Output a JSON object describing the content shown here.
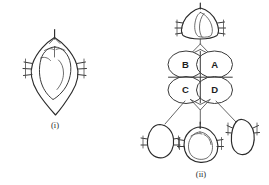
{
  "figure": {
    "kind": "line-art-diagram",
    "background_color": "#ffffff",
    "ink_color": "#3a3a3a",
    "width": 269,
    "height": 185
  },
  "panels": [
    {
      "id": "panel-i",
      "caption": "(i)",
      "description": "single rhomboid structure with inner oval body, apical stem and lateral tick marks"
    },
    {
      "id": "panel-ii",
      "caption": "(ii)",
      "description": "four-celled quadrant with labelled cells connected by lines to four derived structures"
    }
  ],
  "quadrant": {
    "cells": [
      {
        "id": "cell-b",
        "label": "B",
        "position": "top-left"
      },
      {
        "id": "cell-a",
        "label": "A",
        "position": "top-right"
      },
      {
        "id": "cell-c",
        "label": "C",
        "position": "bottom-left"
      },
      {
        "id": "cell-d",
        "label": "D",
        "position": "bottom-right"
      }
    ]
  },
  "derived_structures": [
    {
      "id": "structure-top",
      "position": "top",
      "from_cells": "A,B"
    },
    {
      "id": "structure-bottom-left",
      "position": "bottom-left",
      "from_cells": "C"
    },
    {
      "id": "structure-bottom-center",
      "position": "bottom-center",
      "from_cells": "C,D"
    },
    {
      "id": "structure-bottom-right",
      "position": "bottom-right",
      "from_cells": "D"
    }
  ]
}
